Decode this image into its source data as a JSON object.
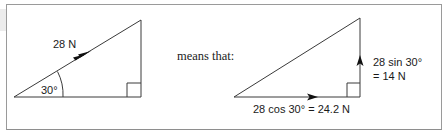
{
  "diagram": {
    "left_triangle": {
      "force_label": "28 N",
      "angle_label": "30°"
    },
    "connector_text": "means that:",
    "right_triangle": {
      "horizontal_label": "28 cos 30° = 24.2 N",
      "vertical_label_line1": "28 sin 30°",
      "vertical_label_line2": "= 14 N"
    },
    "colors": {
      "line": "#3a3a3a",
      "frame": "#9a9a9a",
      "text": "#1a1a1a"
    }
  }
}
